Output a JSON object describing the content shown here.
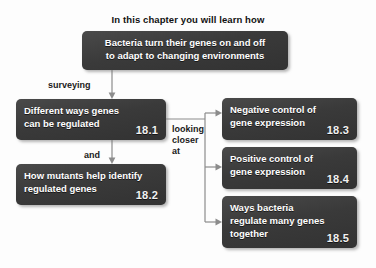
{
  "heading": "In this chapter you will learn how",
  "boxes": {
    "main": {
      "lines": [
        "Bacteria turn their genes on and off",
        "to adapt to changing environments"
      ],
      "section": ""
    },
    "b181": {
      "lines": [
        "Different ways genes",
        "can be regulated"
      ],
      "section": "18.1"
    },
    "b182": {
      "lines": [
        "How mutants help identify",
        "regulated genes"
      ],
      "section": "18.2"
    },
    "b183": {
      "lines": [
        "Negative control of",
        "gene expression"
      ],
      "section": "18.3"
    },
    "b184": {
      "lines": [
        "Positive control of",
        "gene expression"
      ],
      "section": "18.4"
    },
    "b185": {
      "lines": [
        "Ways bacteria",
        "regulate many genes",
        "together"
      ],
      "section": "18.5"
    }
  },
  "connectors": {
    "surveying": "surveying",
    "and": "and",
    "looking_closer_at": [
      "looking",
      "closer",
      "at"
    ]
  },
  "colors": {
    "box_fill": "#3b3b3b",
    "box_text": "#ffffff",
    "background": "#fdfdfd",
    "heading_text": "#111111",
    "connector_line": "#8c8c8c"
  }
}
